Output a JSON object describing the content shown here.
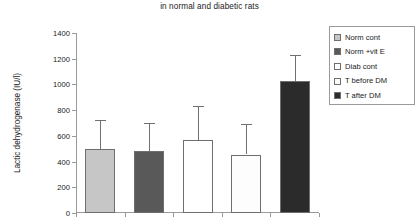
{
  "chart_data": {
    "type": "bar",
    "title": "in normal and diabetic rats",
    "xlabel": "",
    "ylabel": "Lactic dehydrogenase (IU/l)",
    "ylim": [
      0,
      1400
    ],
    "ytick_step": 200,
    "yticks": [
      0,
      200,
      400,
      600,
      800,
      1000,
      1200,
      1400
    ],
    "ytick_labels": [
      "0",
      "200",
      "400",
      "600",
      "800",
      "1000",
      "1200",
      "1400"
    ],
    "grid": false,
    "legend_position": "right",
    "xtick_labels": [],
    "categories": [
      "Norm cont",
      "Norm +vit E",
      "Diab cont",
      "T before DM",
      "T after DM"
    ],
    "values": [
      500,
      480,
      565,
      455,
      1025
    ],
    "error_upper": [
      720,
      700,
      835,
      690,
      1230
    ],
    "series": [
      {
        "name": "Lactic dehydrogenase",
        "values": [
          500,
          480,
          565,
          455,
          1025
        ]
      }
    ],
    "bar_colors": [
      "#c6c6c6",
      "#595959",
      "#ffffff",
      "#fdfdfd",
      "#2b2b2b"
    ]
  },
  "legend": {
    "items": [
      {
        "label": "Norm cont",
        "color": "#c6c6c6"
      },
      {
        "label": "Norm +vit E",
        "color": "#595959"
      },
      {
        "label": "Diab cont",
        "color": "#ffffff"
      },
      {
        "label": "T before DM",
        "color": "#fdfdfd"
      },
      {
        "label": "T after DM",
        "color": "#2b2b2b"
      }
    ]
  }
}
